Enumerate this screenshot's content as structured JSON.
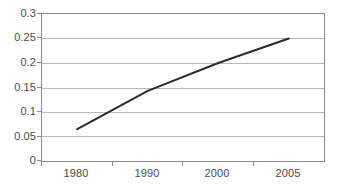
{
  "chart_data": {
    "type": "line",
    "title": "",
    "subtitle": "",
    "xlabel": "",
    "ylabel": "",
    "categories": [
      "1980",
      "1990",
      "2000",
      "2005"
    ],
    "x": [
      1980,
      1990,
      2000,
      2005
    ],
    "series": [
      {
        "name": "",
        "values": [
          0.065,
          0.143,
          0.2,
          0.25
        ],
        "color": "#2b2b2b",
        "line_width": 2,
        "markers": false
      }
    ],
    "ylim": [
      0,
      0.3
    ],
    "ytick_values": [
      0,
      0.05,
      0.1,
      0.15,
      0.2,
      0.25,
      0.3
    ],
    "ytick_labels": [
      "0",
      "0.05",
      "0.1",
      "0.15",
      "0.2",
      "0.25",
      "0.3"
    ],
    "xtick_labels": [
      "1980",
      "1990",
      "2000",
      "2005"
    ],
    "grid": true,
    "grid_axis": "y",
    "grid_color": "#b9b9b9",
    "legend": false,
    "legend_position": "none",
    "plot_border_color": "#8a8a8a",
    "background_color": "#ffffff",
    "tick_label_color": "#4a4a4a",
    "annotations": []
  }
}
